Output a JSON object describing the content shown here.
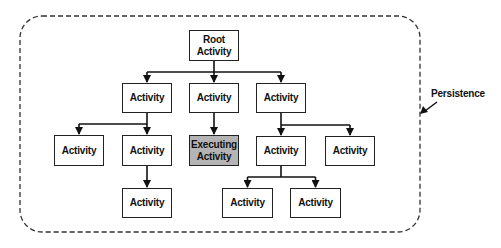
{
  "diagram": {
    "container": {
      "label": "Persistence",
      "style": "dashed-rounded"
    },
    "nodes": [
      {
        "id": "root",
        "lines": [
          "Root",
          "Activity"
        ],
        "x": 189,
        "y": 30,
        "w": 50,
        "h": 31,
        "highlight": false
      },
      {
        "id": "a1",
        "lines": [
          "Activity"
        ],
        "x": 122,
        "y": 83,
        "w": 50,
        "h": 30,
        "highlight": false
      },
      {
        "id": "a2",
        "lines": [
          "Activity"
        ],
        "x": 189,
        "y": 83,
        "w": 50,
        "h": 30,
        "highlight": false
      },
      {
        "id": "a3",
        "lines": [
          "Activity"
        ],
        "x": 256,
        "y": 83,
        "w": 50,
        "h": 30,
        "highlight": false
      },
      {
        "id": "a1-1",
        "lines": [
          "Activity"
        ],
        "x": 54,
        "y": 135,
        "w": 50,
        "h": 31,
        "highlight": false
      },
      {
        "id": "a1-2",
        "lines": [
          "Activity"
        ],
        "x": 122,
        "y": 135,
        "w": 50,
        "h": 31,
        "highlight": false
      },
      {
        "id": "a2-1",
        "lines": [
          "Executing",
          "Activity"
        ],
        "x": 189,
        "y": 135,
        "w": 50,
        "h": 31,
        "highlight": true
      },
      {
        "id": "a3-1",
        "lines": [
          "Activity"
        ],
        "x": 256,
        "y": 136,
        "w": 50,
        "h": 30,
        "highlight": false
      },
      {
        "id": "a3-2",
        "lines": [
          "Activity"
        ],
        "x": 325,
        "y": 136,
        "w": 50,
        "h": 30,
        "highlight": false
      },
      {
        "id": "a1-2-1",
        "lines": [
          "Activity"
        ],
        "x": 122,
        "y": 188,
        "w": 50,
        "h": 30,
        "highlight": false
      },
      {
        "id": "a3-1-1",
        "lines": [
          "Activity"
        ],
        "x": 222,
        "y": 188,
        "w": 51,
        "h": 30,
        "highlight": false
      },
      {
        "id": "a3-1-2",
        "lines": [
          "Activity"
        ],
        "x": 290,
        "y": 188,
        "w": 51,
        "h": 30,
        "highlight": false
      }
    ],
    "edges": [
      {
        "from": "root",
        "to": "a1"
      },
      {
        "from": "root",
        "to": "a2"
      },
      {
        "from": "root",
        "to": "a3"
      },
      {
        "from": "a1",
        "to": "a1-1"
      },
      {
        "from": "a1",
        "to": "a1-2"
      },
      {
        "from": "a2",
        "to": "a2-1"
      },
      {
        "from": "a3",
        "to": "a3-1"
      },
      {
        "from": "a3",
        "to": "a3-2"
      },
      {
        "from": "a1-2",
        "to": "a1-2-1"
      },
      {
        "from": "a3-1",
        "to": "a3-1-1"
      },
      {
        "from": "a3-1",
        "to": "a3-1-2"
      }
    ],
    "colors": {
      "stroke": "#222222",
      "executing_fill": "#b4b4b4",
      "box_fill": "#ffffff"
    }
  }
}
